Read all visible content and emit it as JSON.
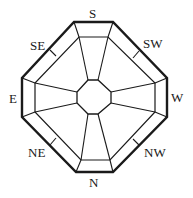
{
  "diagram": {
    "type": "octagonal compass rose",
    "colors": {
      "stroke": "#1a1a1a",
      "background": "#ffffff"
    },
    "labels": [
      {
        "id": "S",
        "text": "S",
        "x": 96,
        "y": 18
      },
      {
        "id": "SW",
        "text": "SW",
        "x": 143,
        "y": 48
      },
      {
        "id": "W",
        "text": "W",
        "x": 171,
        "y": 102
      },
      {
        "id": "NW",
        "text": "NW",
        "x": 144,
        "y": 157
      },
      {
        "id": "N",
        "text": "N",
        "x": 93,
        "y": 187
      },
      {
        "id": "NE",
        "text": "NE",
        "x": 29,
        "y": 157
      },
      {
        "id": "E",
        "text": "E",
        "x": 10,
        "y": 103
      },
      {
        "id": "SE",
        "text": "SE",
        "x": 30,
        "y": 50
      }
    ]
  }
}
